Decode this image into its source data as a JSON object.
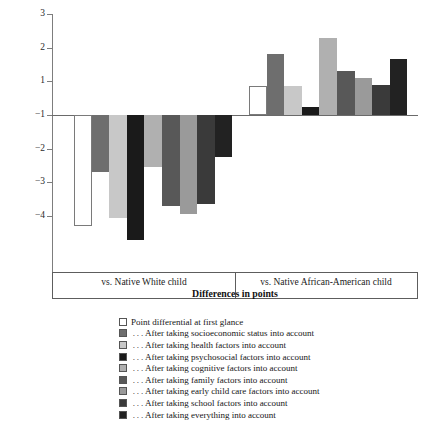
{
  "chart_data": {
    "type": "bar",
    "title": "",
    "xlabel": "Differences in points",
    "ylabel": "",
    "ylim": [
      -4.6,
      3
    ],
    "yticks": [
      3,
      2,
      1,
      -1,
      -2,
      -3,
      -4
    ],
    "ytick_labels": [
      "3",
      "2",
      "1",
      "−1",
      "−2",
      "−3",
      "−4"
    ],
    "baseline_tick_label": "−1",
    "grid": false,
    "legend_position": "below",
    "categories": [
      "vs. Native White child",
      "vs. Native African-American child"
    ],
    "series": [
      {
        "name": "Point differential at first glance",
        "color": "#ffffff",
        "values": [
          -3.3,
          0.85
        ]
      },
      {
        "name": "... After taking socioeconomic status into account",
        "color": "#6e6e6e",
        "values": [
          -1.7,
          1.8
        ]
      },
      {
        "name": "... After taking health factors into account",
        "color": "#c8c8c8",
        "values": [
          -3.05,
          0.85
        ]
      },
      {
        "name": "... After taking psychosocial factors into account",
        "color": "#1a1a1a",
        "values": [
          -3.7,
          0.25
        ]
      },
      {
        "name": "... After taking cognitive factors into account",
        "color": "#b0b0b0",
        "values": [
          -1.55,
          2.3
        ]
      },
      {
        "name": "... After taking family factors into account",
        "color": "#585858",
        "values": [
          -2.7,
          1.3
        ]
      },
      {
        "name": "... After taking early child care factors into account",
        "color": "#9a9a9a",
        "values": [
          -2.95,
          1.1
        ]
      },
      {
        "name": "... After taking school factors into account",
        "color": "#3a3a3a",
        "values": [
          -2.65,
          0.9
        ]
      },
      {
        "name": "... After taking everything into account",
        "color": "#222222",
        "values": [
          -1.25,
          1.65
        ]
      }
    ]
  },
  "legend": {
    "items": [
      {
        "label": "Point differential at first glance",
        "color": "#ffffff"
      },
      {
        "label": " . . . After taking socioeconomic status into account",
        "color": "#6e6e6e"
      },
      {
        "label": " . . . After taking health factors into account",
        "color": "#c8c8c8"
      },
      {
        "label": " . . . After taking psychosocial factors into account",
        "color": "#1a1a1a"
      },
      {
        "label": " . . . After taking cognitive factors into account",
        "color": "#b0b0b0"
      },
      {
        "label": " . . . After taking family factors into account",
        "color": "#585858"
      },
      {
        "label": " . . . After taking early child care factors into account",
        "color": "#9a9a9a"
      },
      {
        "label": " . . . After taking school factors into account",
        "color": "#3a3a3a"
      },
      {
        "label": " . . . After taking everything into account",
        "color": "#222222"
      }
    ]
  }
}
